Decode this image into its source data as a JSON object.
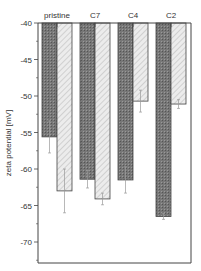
{
  "chart_data": {
    "type": "bar",
    "title": "",
    "xlabel": "",
    "ylabel": "zeta potential [mV]",
    "ylim": [
      -73,
      -40
    ],
    "yticks": [
      -40,
      -45,
      -50,
      -55,
      -60,
      -65,
      -70
    ],
    "categories": [
      "pristine",
      "C7",
      "C4",
      "C2"
    ],
    "category_label_position": "top",
    "series": [
      {
        "name": "series-1 (dark crosshatch)",
        "values": [
          -55.6,
          -61.4,
          -61.5,
          -66.5
        ],
        "errors": [
          2.2,
          1.2,
          1.8,
          0.4
        ],
        "color": "#6e6e6e"
      },
      {
        "name": "series-2 (light hatched)",
        "values": [
          -63.0,
          -64.1,
          -50.7,
          -51.1
        ],
        "errors": [
          3.0,
          0.8,
          1.5,
          0.6
        ],
        "color": "#e0e0e0"
      }
    ],
    "legend": null,
    "grid": false,
    "error_bars": true
  },
  "axis": {
    "ylabel": "zeta potential [mV]",
    "ytick_labels": [
      "-40",
      "-45",
      "-50",
      "-55",
      "-60",
      "-65",
      "-70"
    ]
  },
  "labels": {
    "cat0": "pristine",
    "cat1": "C7",
    "cat2": "C4",
    "cat3": "C2"
  }
}
